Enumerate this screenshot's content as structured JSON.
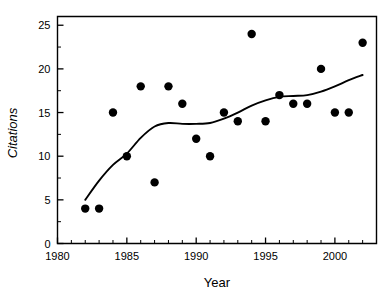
{
  "chart_data": {
    "type": "scatter",
    "title": "",
    "xlabel": "Year",
    "ylabel": "Citations",
    "xlim": [
      1980,
      2003
    ],
    "ylim": [
      0,
      26
    ],
    "grid": false,
    "legend": null,
    "x_ticks_major": [
      1980,
      1985,
      1990,
      1995,
      2000
    ],
    "x_tick_labels": [
      "1980",
      "1985",
      "1990",
      "1995",
      "2000"
    ],
    "x_minor_step": 1,
    "y_ticks_major": [
      0,
      5,
      10,
      15,
      20,
      25
    ],
    "y_tick_labels": [
      "0",
      "5",
      "10",
      "15",
      "20",
      "25"
    ],
    "y_minor_step": 2.5,
    "marker": "filled-circle",
    "marker_color": "#000000",
    "marker_size_px": 4.2,
    "x": [
      1982,
      1983,
      1984,
      1985,
      1986,
      1987,
      1988,
      1989,
      1990,
      1991,
      1992,
      1993,
      1994,
      1995,
      1996,
      1997,
      1998,
      1999,
      2000,
      2001,
      2002
    ],
    "y": [
      4,
      4,
      15,
      10,
      18,
      7,
      18,
      16,
      12,
      10,
      15,
      14,
      24,
      14,
      17,
      16,
      16,
      20,
      15,
      15,
      23
    ],
    "series": [
      {
        "name": "Citations per year",
        "type": "scatter",
        "points": [
          {
            "x": 1982,
            "y": 4
          },
          {
            "x": 1983,
            "y": 4
          },
          {
            "x": 1984,
            "y": 15
          },
          {
            "x": 1985,
            "y": 10
          },
          {
            "x": 1986,
            "y": 18
          },
          {
            "x": 1987,
            "y": 7
          },
          {
            "x": 1988,
            "y": 18
          },
          {
            "x": 1989,
            "y": 16
          },
          {
            "x": 1990,
            "y": 12
          },
          {
            "x": 1991,
            "y": 10
          },
          {
            "x": 1992,
            "y": 15
          },
          {
            "x": 1993,
            "y": 14
          },
          {
            "x": 1994,
            "y": 24
          },
          {
            "x": 1995,
            "y": 14
          },
          {
            "x": 1996,
            "y": 17
          },
          {
            "x": 1997,
            "y": 16
          },
          {
            "x": 1998,
            "y": 16
          },
          {
            "x": 1999,
            "y": 20
          },
          {
            "x": 2000,
            "y": 15
          },
          {
            "x": 2001,
            "y": 15
          },
          {
            "x": 2002,
            "y": 23
          }
        ]
      },
      {
        "name": "Smoothed trend",
        "type": "line",
        "color": "#000000",
        "points": [
          {
            "x": 1982.0,
            "y": 5.0
          },
          {
            "x": 1983.0,
            "y": 7.2
          },
          {
            "x": 1984.0,
            "y": 9.0
          },
          {
            "x": 1985.0,
            "y": 10.3
          },
          {
            "x": 1986.0,
            "y": 12.1
          },
          {
            "x": 1987.0,
            "y": 13.4
          },
          {
            "x": 1988.0,
            "y": 13.8
          },
          {
            "x": 1989.0,
            "y": 13.7
          },
          {
            "x": 1990.0,
            "y": 13.7
          },
          {
            "x": 1991.0,
            "y": 13.8
          },
          {
            "x": 1992.0,
            "y": 14.3
          },
          {
            "x": 1993.0,
            "y": 15.0
          },
          {
            "x": 1994.0,
            "y": 15.8
          },
          {
            "x": 1995.0,
            "y": 16.4
          },
          {
            "x": 1996.0,
            "y": 16.8
          },
          {
            "x": 1997.0,
            "y": 16.9
          },
          {
            "x": 1998.0,
            "y": 17.0
          },
          {
            "x": 1999.0,
            "y": 17.4
          },
          {
            "x": 2000.0,
            "y": 18.0
          },
          {
            "x": 2001.0,
            "y": 18.7
          },
          {
            "x": 2002.0,
            "y": 19.3
          }
        ]
      }
    ]
  }
}
